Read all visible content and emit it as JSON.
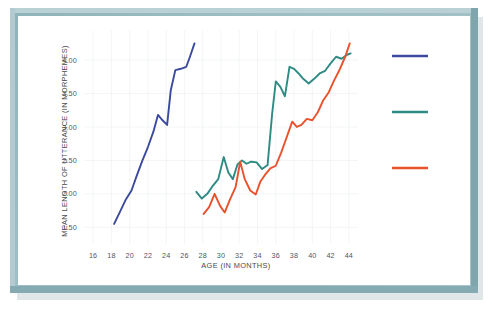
{
  "figure": {
    "frame_color": "#9dbec4",
    "background_color": "#ffffff"
  },
  "chart_data": {
    "type": "line",
    "title": "",
    "xlabel": "AGE (IN MONTHS)",
    "ylabel": "MEAN LENGTH OF UTTERANCE (IN MORPHEMES)",
    "xlim": [
      15,
      45
    ],
    "ylim": [
      1.25,
      4.45
    ],
    "xticks": [
      16,
      18,
      20,
      22,
      24,
      26,
      28,
      30,
      32,
      34,
      36,
      38,
      40,
      42,
      44
    ],
    "xtick_labels": [
      "16",
      "18",
      "20",
      "22",
      "24",
      "26",
      "28",
      "30",
      "32",
      "34",
      "36",
      "38",
      "40",
      "42",
      "44"
    ],
    "yticks": [
      1.5,
      2.0,
      2.5,
      3.0,
      3.5,
      4.0
    ],
    "ytick_labels": [
      "1.50",
      "2.00",
      "2.50",
      "3.00",
      "3.50",
      "4.00"
    ],
    "grid": true,
    "grid_axis": "both",
    "legend_position": "right",
    "series": [
      {
        "name": "series-1",
        "color": "#3c4a9e",
        "x": [
          18.3,
          19.0,
          19.6,
          20.2,
          20.8,
          21.4,
          22.0,
          22.6,
          23.1,
          23.6,
          24.1,
          24.5,
          25.0,
          25.6,
          26.2,
          26.6,
          27.1
        ],
        "values": [
          1.55,
          1.75,
          1.92,
          2.05,
          2.28,
          2.5,
          2.7,
          2.93,
          3.18,
          3.1,
          3.03,
          3.55,
          3.85,
          3.87,
          3.9,
          4.05,
          4.25
        ]
      },
      {
        "name": "series-2",
        "color": "#2e8a82",
        "x": [
          27.3,
          27.9,
          28.5,
          29.1,
          29.7,
          30.3,
          30.8,
          31.3,
          31.8,
          32.3,
          32.8,
          33.3,
          33.9,
          34.5,
          35.1,
          35.6,
          36.0,
          36.5,
          37.0,
          37.5,
          38.0,
          38.5,
          39.0,
          39.6,
          40.2,
          40.8,
          41.4,
          42.0,
          42.6,
          43.2,
          43.8,
          44.2
        ],
        "values": [
          2.03,
          1.93,
          2.0,
          2.12,
          2.22,
          2.55,
          2.32,
          2.22,
          2.44,
          2.5,
          2.45,
          2.48,
          2.47,
          2.37,
          2.43,
          3.2,
          3.68,
          3.6,
          3.46,
          3.9,
          3.87,
          3.8,
          3.72,
          3.65,
          3.72,
          3.8,
          3.84,
          3.95,
          4.05,
          4.02,
          4.08,
          4.1
        ]
      },
      {
        "name": "series-3",
        "color": "#e8512c",
        "x": [
          28.1,
          28.7,
          29.3,
          29.9,
          30.4,
          31.0,
          31.6,
          32.1,
          32.6,
          33.2,
          33.8,
          34.3,
          34.9,
          35.4,
          36.0,
          36.6,
          37.2,
          37.8,
          38.3,
          38.8,
          39.4,
          40.0,
          40.6,
          41.2,
          41.8,
          42.4,
          43.0,
          43.6,
          44.1
        ],
        "values": [
          1.7,
          1.8,
          2.0,
          1.82,
          1.72,
          1.92,
          2.1,
          2.48,
          2.22,
          2.05,
          1.99,
          2.18,
          2.3,
          2.38,
          2.42,
          2.62,
          2.85,
          3.08,
          3.0,
          3.03,
          3.12,
          3.1,
          3.22,
          3.4,
          3.52,
          3.7,
          3.86,
          4.05,
          4.25
        ]
      }
    ]
  },
  "legend": {
    "entries": [
      {
        "name": "legend-entry-1",
        "color": "#3c4a9e",
        "label": ""
      },
      {
        "name": "legend-entry-2",
        "color": "#2e8a82",
        "label": ""
      },
      {
        "name": "legend-entry-3",
        "color": "#e8512c",
        "label": ""
      }
    ]
  }
}
